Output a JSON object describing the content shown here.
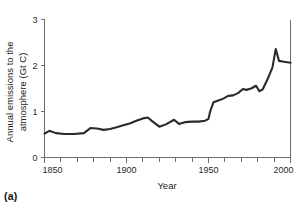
{
  "figure": {
    "panel_label": "(a)"
  },
  "chart_data": {
    "type": "line",
    "title": "",
    "xlabel": "Year",
    "ylabel": "Annual emissions to the atmosphere (Gt C)",
    "ylabel_lines": [
      "Annual emissions to the",
      "atmosphere (Gt C)"
    ],
    "xlim": [
      1850,
      2000
    ],
    "ylim": [
      0,
      3
    ],
    "xticks": [
      1850,
      1900,
      1950,
      2000
    ],
    "xtick_labels": [
      "1850",
      "1900",
      "1950",
      "2000"
    ],
    "xminor_step": 10,
    "yticks": [
      0,
      1,
      2,
      3
    ],
    "ytick_labels": [
      "0",
      "1",
      "2",
      "3"
    ],
    "grid": false,
    "legend": null,
    "line_color": "#2b2b2b",
    "axis_color": "#6e6e6e",
    "series": [
      {
        "name": "Annual carbon emissions",
        "x": [
          1850,
          1853,
          1857,
          1862,
          1868,
          1874,
          1878,
          1882,
          1886,
          1890,
          1894,
          1898,
          1902,
          1906,
          1910,
          1913,
          1916,
          1920,
          1924,
          1929,
          1932,
          1936,
          1940,
          1944,
          1948,
          1950,
          1951,
          1953,
          1956,
          1959,
          1962,
          1965,
          1968,
          1971,
          1973,
          1976,
          1979,
          1981,
          1983,
          1986,
          1989,
          1991,
          1993,
          1996,
          2000
        ],
        "y": [
          0.52,
          0.58,
          0.53,
          0.51,
          0.51,
          0.53,
          0.64,
          0.63,
          0.6,
          0.62,
          0.66,
          0.7,
          0.74,
          0.8,
          0.85,
          0.87,
          0.78,
          0.67,
          0.72,
          0.82,
          0.73,
          0.77,
          0.78,
          0.78,
          0.8,
          0.84,
          1.0,
          1.2,
          1.24,
          1.28,
          1.34,
          1.35,
          1.4,
          1.49,
          1.47,
          1.5,
          1.56,
          1.44,
          1.48,
          1.7,
          1.96,
          2.36,
          2.1,
          2.08,
          2.06
        ]
      }
    ]
  }
}
